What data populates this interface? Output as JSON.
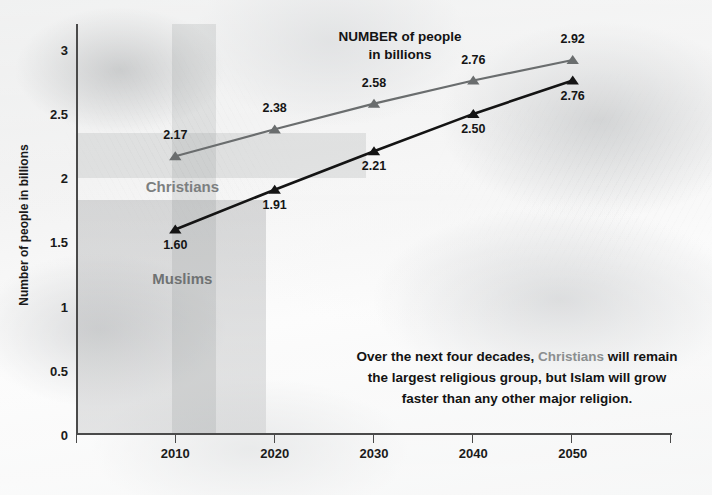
{
  "chart_data": {
    "type": "line",
    "title": "NUMBER of people\nin billions",
    "xlabel": "",
    "ylabel": "Number of people in billions",
    "x": [
      "2010",
      "2020",
      "2030",
      "2040",
      "2050"
    ],
    "categories": [
      "2010",
      "2020",
      "2030",
      "2040",
      "2050"
    ],
    "ylim": [
      0,
      3.2
    ],
    "yticks": [
      "0",
      "0.5",
      "1",
      "1.5",
      "2",
      "2.5",
      "3"
    ],
    "ytick_values": [
      0,
      0.5,
      1,
      1.5,
      2,
      2.5,
      3
    ],
    "grid": false,
    "legend_position": "inline-labels",
    "series": [
      {
        "name": "Christians",
        "color": "#6a6d6e",
        "values": [
          2.17,
          2.38,
          2.58,
          2.76,
          2.92
        ],
        "labels": [
          "2.17",
          "2.38",
          "2.58",
          "2.76",
          "2.92"
        ],
        "label_side": [
          "above",
          "above",
          "above",
          "above",
          "above"
        ]
      },
      {
        "name": "Muslims",
        "color": "#141414",
        "values": [
          1.6,
          1.91,
          2.21,
          2.5,
          2.76
        ],
        "labels": [
          "1.60",
          "1.91",
          "2.21",
          "2.50",
          "2.76"
        ],
        "label_side": [
          "below",
          "below",
          "below",
          "below",
          "below"
        ]
      }
    ],
    "annotations": [
      "Over the next four decades, Christians will remain the largest religious group, but Islam will grow faster than any other major religion."
    ]
  },
  "caption": {
    "line1_a": "Over the next four decades, ",
    "line1_highlight": "Christians",
    "line1_b": " will remain",
    "line2": "the largest religious group, but Islam will grow",
    "line3": "faster than any other major religion."
  },
  "colors": {
    "christians_line": "#6a6d6e",
    "muslims_line": "#141414",
    "axis": "#4a4a4a",
    "label_text": "#151515",
    "series_name_text": "#7c7f80"
  }
}
